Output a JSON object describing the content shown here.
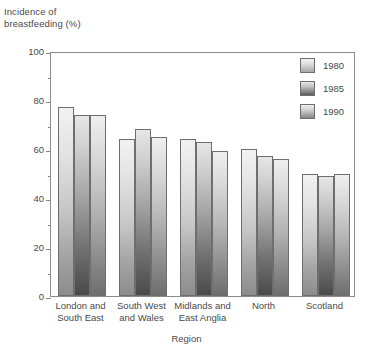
{
  "chart_data": {
    "type": "bar",
    "title": "",
    "ylabel": "Incidence of\nbreastfeeding (%)",
    "xlabel": "Region",
    "ylim": [
      0,
      100
    ],
    "ymajor_step": 20,
    "yminor_step": 10,
    "grid": false,
    "legend_position": "top-right-outside",
    "categories": [
      "London and\nSouth East",
      "South West\nand Wales",
      "Midlands and\nEast Anglia",
      "North",
      "Scotland"
    ],
    "series": [
      {
        "name": "1980",
        "values": [
          77,
          64,
          64,
          60,
          50
        ]
      },
      {
        "name": "1985",
        "values": [
          74,
          68,
          63,
          57,
          49
        ]
      },
      {
        "name": "1990",
        "values": [
          74,
          65,
          59,
          56,
          50
        ]
      }
    ],
    "y_ticks_major": [
      "0",
      "20",
      "40",
      "60",
      "80",
      "100"
    ],
    "y_tick_values_major": [
      0,
      20,
      40,
      60,
      80,
      100
    ],
    "y_tick_values_minor": [
      10,
      30,
      50,
      70,
      90
    ]
  },
  "legend": {
    "items": [
      {
        "label": "1980",
        "key": "s1980"
      },
      {
        "label": "1985",
        "key": "s1985"
      },
      {
        "label": "1990",
        "key": "s1990"
      }
    ]
  },
  "colors": {
    "axis": "#8a8a8a",
    "bar_outline": "#6e6e6e",
    "text": "#4a4a4a",
    "background": "#ffffff"
  }
}
